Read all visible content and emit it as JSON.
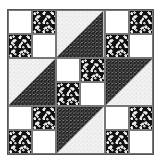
{
  "block": {
    "name": "quilt-block",
    "grid": "3x3 units of 2x2 cells",
    "colors": {
      "white": "#ffffff",
      "dark_floral": "#1a1a1a",
      "light_floral": "#e8e8e8",
      "border": "#555555"
    },
    "units": [
      {
        "type": "fourpatch",
        "cells": [
          "white",
          "dark",
          "dark",
          "white"
        ]
      },
      {
        "type": "hst",
        "upper_left": "light",
        "lower_right": "dark"
      },
      {
        "type": "fourpatch",
        "cells": [
          "white",
          "dark",
          "dark",
          "white"
        ]
      },
      {
        "type": "hst",
        "upper_left": "light",
        "lower_right": "dark"
      },
      {
        "type": "fourpatch",
        "cells": [
          "white",
          "dark",
          "dark",
          "white"
        ]
      },
      {
        "type": "hst",
        "upper_left": "dark",
        "lower_right": "light"
      },
      {
        "type": "fourpatch",
        "cells": [
          "white",
          "dark",
          "dark",
          "white"
        ]
      },
      {
        "type": "hst",
        "upper_left": "dark",
        "lower_right": "light"
      },
      {
        "type": "fourpatch",
        "cells": [
          "white",
          "dark",
          "dark",
          "white"
        ]
      }
    ]
  }
}
